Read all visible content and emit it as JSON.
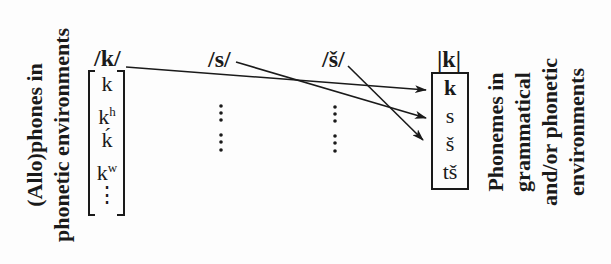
{
  "left_label": {
    "line1": "(Allo)phones in",
    "line2": "phonetic environments"
  },
  "right_label": {
    "line1": "Phonemes in",
    "line2": "grammatical",
    "line3": "and/or phonetic",
    "line4": "environments"
  },
  "phonemes_top": [
    {
      "label": "/k/"
    },
    {
      "label": "/s/"
    },
    {
      "label": "/š/"
    }
  ],
  "allophone_bracket": {
    "items": [
      {
        "base": "k",
        "sup": ""
      },
      {
        "base": "k",
        "sup": "h"
      },
      {
        "base": "ḱ",
        "sup": ""
      },
      {
        "base": "k",
        "sup": "w"
      },
      {
        "base": "⋮",
        "sup": ""
      }
    ]
  },
  "ellipsis_columns": [
    {
      "label": "⋮\n⋮"
    },
    {
      "label": "⋮\n⋮"
    }
  ],
  "target_box": {
    "header": "|k|",
    "items": [
      "k",
      "s",
      "š",
      "tš"
    ]
  },
  "arrows": [
    {
      "from": "/k/",
      "to": "k"
    },
    {
      "from": "/s/",
      "to": "s"
    },
    {
      "from": "/š/",
      "to": "š"
    }
  ],
  "colors": {
    "ink": "#1a1a1a",
    "background": "#fdfdfd"
  }
}
